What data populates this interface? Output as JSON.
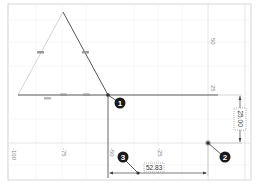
{
  "view": {
    "type": "cad-sketch-canvas",
    "colors": {
      "background": "#ffffff",
      "frame": "#d6d6d6",
      "grid_minor": "#f1f1f1",
      "grid_major": "#e2e2e2",
      "construction_line": "#cfcfcf",
      "sketch_line": "#555555",
      "dimension_line": "#444444",
      "constraint_marker": "#9a9a9a",
      "callout_fill": "#1a1a1a",
      "tick_label": "#8a8a8a"
    }
  },
  "axes": {
    "x_ticks": [
      {
        "label": "-100",
        "x": 12
      },
      {
        "label": "-75",
        "x": 62
      },
      {
        "label": "-50",
        "x": 110
      },
      {
        "label": "-25",
        "x": 158
      }
    ],
    "y_ticks": [
      {
        "label": "50",
        "y": 42
      },
      {
        "label": "25",
        "y": 89
      }
    ]
  },
  "dimensions": {
    "horizontal": {
      "value": "52.83"
    },
    "vertical": {
      "value": "25.00"
    }
  },
  "callouts": [
    {
      "number": "1"
    },
    {
      "number": "2"
    },
    {
      "number": "3"
    }
  ]
}
